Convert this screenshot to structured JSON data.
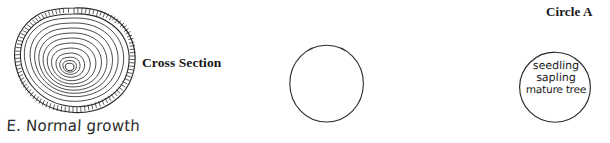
{
  "figure": {
    "panels": [
      {
        "id": "cross-section",
        "heading": "Cross Section",
        "caption": "E. Normal growth",
        "diagram": "tree-trunk-cross-section-with-growth-rings",
        "ring_count": 11,
        "has_bark_band": true
      },
      {
        "id": "circle-a",
        "heading": "Circle A",
        "contents": [],
        "filled": false
      },
      {
        "id": "circle-b",
        "heading": "Circle B",
        "contents": [
          "seedling",
          "sapling",
          "mature tree"
        ],
        "filled": true
      }
    ]
  },
  "labels": {
    "cross_section": "Cross Section",
    "circle_a": "Circle A",
    "circle_b": "Circle B",
    "normal_growth": "E. Normal growth"
  },
  "circle_b_stages": {
    "stage_1": "seedling",
    "stage_2": "sapling",
    "stage_3": "mature tree"
  },
  "colors": {
    "ink": "#2a2a2a",
    "heading_text": "#171717",
    "handwriting": "#2b2b2b",
    "background": "#ffffff"
  }
}
